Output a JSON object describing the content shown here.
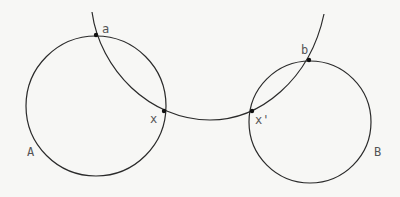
{
  "diagram": {
    "stroke_color": "#2a2a2a",
    "label_color": "#555555",
    "circles": [
      {
        "id": "A",
        "label": "A",
        "cx": 96,
        "cy": 106,
        "r": 70,
        "label_x": 27,
        "label_y": 156
      },
      {
        "id": "B",
        "label": "B",
        "cx": 310,
        "cy": 122,
        "r": 61,
        "label_x": 374,
        "label_y": 156
      }
    ],
    "arc": {
      "path": "M 92 12 C 100 70, 150 120, 210 120 C 260 120, 310 80, 324 14"
    },
    "points": [
      {
        "id": "a",
        "label": "a",
        "x": 96,
        "y": 35,
        "label_x": 102,
        "label_y": 33
      },
      {
        "id": "x",
        "label": "x",
        "x": 164,
        "y": 111,
        "label_x": 150,
        "label_y": 123
      },
      {
        "id": "x_prime",
        "label": "x'",
        "x": 252,
        "y": 111,
        "label_x": 255,
        "label_y": 124
      },
      {
        "id": "b",
        "label": "b",
        "x": 309,
        "y": 60,
        "label_x": 301,
        "label_y": 54
      }
    ]
  }
}
